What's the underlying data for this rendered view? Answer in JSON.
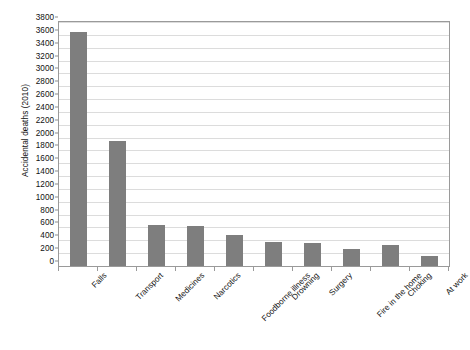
{
  "chart_data": {
    "type": "bar",
    "title": "",
    "subtitle": "",
    "xlabel": "",
    "ylabel": "Accidental deaths (2010)",
    "categories": [
      "Falls",
      "Transport",
      "Medicines",
      "Narcotics",
      "Foodborne illness",
      "Drowning",
      "Surgery",
      "Fire in the home",
      "Choking",
      "At work"
    ],
    "values": [
      3650,
      1950,
      640,
      620,
      490,
      380,
      355,
      265,
      320,
      155
    ],
    "ylim": [
      0,
      3800
    ],
    "ytick_step": 200,
    "yticks": [
      "0",
      "200",
      "400",
      "600",
      "800",
      "1000",
      "1200",
      "1400",
      "1600",
      "1800",
      "2000",
      "2200",
      "2400",
      "2600",
      "2800",
      "3000",
      "3200",
      "3400",
      "3600",
      "3800"
    ],
    "grid": "horizontal",
    "legend": "none",
    "bar_color": "#7e7e7e",
    "gridline_color": "#dcdcdc",
    "axis_color": "#9a9a9a",
    "background_color": "#ffffff"
  }
}
